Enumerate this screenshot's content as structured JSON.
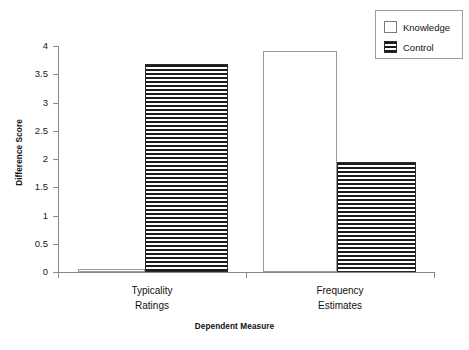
{
  "chart_data": {
    "type": "bar",
    "title": "",
    "xlabel": "Dependent Measure",
    "ylabel": "Difference Score",
    "categories": [
      "Typicality Ratings",
      "Frequency Estimates"
    ],
    "category_lines": [
      [
        "Typicality",
        "Ratings"
      ],
      [
        "Frequency",
        "Estimates"
      ]
    ],
    "series": [
      {
        "name": "Knowledge",
        "values": [
          0.05,
          3.92
        ],
        "fill": "solid-white"
      },
      {
        "name": "Control",
        "values": [
          3.68,
          1.95
        ],
        "fill": "horizontal-stripes"
      }
    ],
    "ylim": [
      0,
      4
    ],
    "ytick_values": [
      0,
      0.5,
      1,
      1.5,
      2,
      2.5,
      3,
      3.5,
      4
    ],
    "ytick_labels": [
      "0",
      "0.5",
      "1",
      "1.5",
      "2",
      "2.5",
      "3",
      "3.5",
      "4"
    ],
    "grid": false,
    "legend_position": "top-right",
    "legend_entries": [
      "Knowledge",
      "Control"
    ],
    "colors": {
      "axis": "#8a8a8a",
      "text": "#111111",
      "bar_knowledge": "#ffffff",
      "bar_control_stripe": "#1c1c1c",
      "legend_border": "#9e9e9e"
    }
  },
  "legend": {
    "items": [
      {
        "label": "Knowledge",
        "swatch": "empty-square-icon"
      },
      {
        "label": "Control",
        "swatch": "striped-square-icon"
      }
    ]
  },
  "axes": {
    "y_title": "Difference Score",
    "x_title": "Dependent Measure"
  }
}
